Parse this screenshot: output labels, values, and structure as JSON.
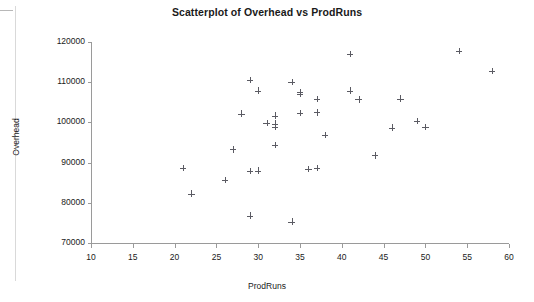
{
  "chart_data": {
    "type": "scatter",
    "title": "Scatterplot of Overhead vs ProdRuns",
    "xlabel": "ProdRuns",
    "ylabel": "Overhead",
    "xlim": [
      10,
      60
    ],
    "ylim": [
      70000,
      120000
    ],
    "xticks": [
      10,
      15,
      20,
      25,
      30,
      35,
      40,
      45,
      50,
      55,
      60
    ],
    "yticks": [
      70000,
      80000,
      90000,
      100000,
      110000,
      120000
    ],
    "xtick_labels": [
      "10",
      "15",
      "20",
      "25",
      "30",
      "35",
      "40",
      "45",
      "50",
      "55",
      "60"
    ],
    "ytick_labels": [
      "70000",
      "80000",
      "90000",
      "100000",
      "110000",
      "120000"
    ],
    "grid": false,
    "legend": null,
    "marker": "plus",
    "marker_color": "#5b5b63",
    "series": [
      {
        "name": "Overhead",
        "points": [
          {
            "x": 21,
            "y": 88700
          },
          {
            "x": 22,
            "y": 82300
          },
          {
            "x": 26,
            "y": 85600
          },
          {
            "x": 27,
            "y": 93300
          },
          {
            "x": 28,
            "y": 102200
          },
          {
            "x": 29,
            "y": 110500
          },
          {
            "x": 29,
            "y": 87900
          },
          {
            "x": 29,
            "y": 76800
          },
          {
            "x": 30,
            "y": 107900
          },
          {
            "x": 30,
            "y": 88000
          },
          {
            "x": 31,
            "y": 99800
          },
          {
            "x": 32,
            "y": 101700
          },
          {
            "x": 32,
            "y": 99700
          },
          {
            "x": 32,
            "y": 98800
          },
          {
            "x": 32,
            "y": 94400
          },
          {
            "x": 34,
            "y": 110000
          },
          {
            "x": 34,
            "y": 75300
          },
          {
            "x": 35,
            "y": 107500
          },
          {
            "x": 35,
            "y": 107000
          },
          {
            "x": 35,
            "y": 102400
          },
          {
            "x": 36,
            "y": 88400
          },
          {
            "x": 37,
            "y": 105800
          },
          {
            "x": 37,
            "y": 102500
          },
          {
            "x": 37,
            "y": 88600
          },
          {
            "x": 38,
            "y": 96800
          },
          {
            "x": 41,
            "y": 117000
          },
          {
            "x": 41,
            "y": 107900
          },
          {
            "x": 42,
            "y": 105700
          },
          {
            "x": 44,
            "y": 91800
          },
          {
            "x": 46,
            "y": 98700
          },
          {
            "x": 47,
            "y": 105900
          },
          {
            "x": 49,
            "y": 100400
          },
          {
            "x": 50,
            "y": 98900
          },
          {
            "x": 54,
            "y": 117800
          },
          {
            "x": 58,
            "y": 112800
          }
        ]
      }
    ]
  }
}
